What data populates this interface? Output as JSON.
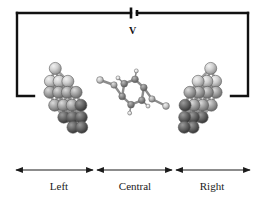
{
  "figure": {
    "background_color": "#ffffff",
    "width": 265,
    "height": 203
  },
  "circuit": {
    "wire_color": "#111111",
    "wire_width": 2.4,
    "battery": {
      "name": "voltage-source",
      "label": "V",
      "long_plate_x": 131,
      "short_plate_x": 137,
      "y_center": 13
    },
    "left_lead": {
      "top_y": 13,
      "bottom_y": 96,
      "x": 17,
      "end_x": 34
    },
    "right_lead": {
      "top_y": 13,
      "bottom_y": 96,
      "x": 248,
      "end_x": 231
    },
    "top_wire": {
      "y": 13,
      "from_x": 17,
      "to_x": 248
    }
  },
  "molecule": {
    "name": "benzene-1,4-dithiolate bridging two gold clusters",
    "ring": {
      "label": "benzene-ring",
      "center_x": 133,
      "center_y": 92,
      "radius": 11.5,
      "carbon_color": "#7a7a7a",
      "carbon_radius": 3.4,
      "hydrogen_color": "#d8d8d8",
      "hydrogen_radius": 2.0
    },
    "sulfur": {
      "label": "sulfur-linker",
      "color": "#9b9b9b",
      "radius": 3.2,
      "left": {
        "x": 114,
        "y": 85
      },
      "right": {
        "x": 152,
        "y": 99
      }
    },
    "bond_color": "#8c8c8c"
  },
  "electrodes": {
    "left": {
      "name": "left-gold-cluster",
      "atom_color_light": "#d6d6d6",
      "atom_color_mid": "#9a9a9a",
      "atom_color_dark": "#4a4a4a",
      "bond_color": "#8f8f8f",
      "atom_radius": 6.0
    },
    "right": {
      "name": "right-gold-cluster",
      "atom_color_light": "#d6d6d6",
      "atom_color_mid": "#9a9a9a",
      "atom_color_dark": "#4a4a4a",
      "bond_color": "#8f8f8f",
      "atom_radius": 6.0
    }
  },
  "regions": {
    "axis_color": "#1a1a1a",
    "arrow_y": 170,
    "items": [
      {
        "key": "left",
        "label": "Left",
        "from_x": 16,
        "to_x": 93
      },
      {
        "key": "central",
        "label": "Central",
        "from_x": 97,
        "to_x": 172
      },
      {
        "key": "right",
        "label": "Right",
        "from_x": 176,
        "to_x": 250
      }
    ]
  }
}
